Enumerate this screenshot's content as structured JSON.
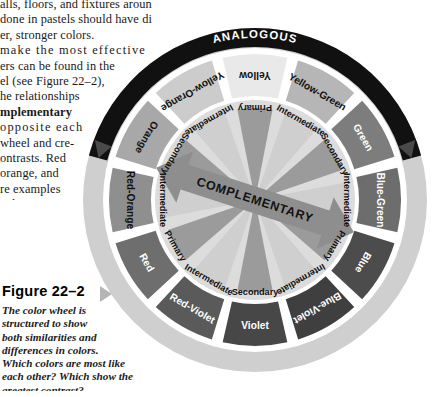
{
  "body_text": {
    "lines": [
      {
        "text": "alls, floors, and fixtures around them.",
        "bold": false,
        "clip_top": true
      },
      {
        "text": "done in pastels should have dis-",
        "bold": false
      },
      {
        "text": "er, stronger colors.",
        "bold": false
      },
      {
        "text": "make the most effective",
        "bold": false,
        "spaced": true
      },
      {
        "text": "ers can be found in the",
        "bold": false
      },
      {
        "text": "el (see Figure 22–2),",
        "bold": false
      },
      {
        "text": "he relationships",
        "bold": false
      },
      {
        "text": "mplementary",
        "bold": true
      },
      {
        "text": "opposite each",
        "bold": false,
        "spaced": true
      },
      {
        "text": "wheel and cre-",
        "bold": false
      },
      {
        "text": "ontrasts.  Red",
        "bold": false
      },
      {
        "text": "orange, and",
        "bold": false
      },
      {
        "text": "re examples",
        "bold": false
      },
      {
        "text": "colors.",
        "bold": false
      }
    ]
  },
  "figure": {
    "title": "Figure 22–2",
    "caption_lines": [
      "The color wheel is",
      "structured to show",
      "both similarities and",
      "differences in colors.",
      "Which colors are most like",
      "each other? Which show the",
      "greatest contrast?"
    ]
  },
  "wheel": {
    "banner_label": "ANALOGOUS",
    "complementary_label": "COMPLEMENTARY",
    "hues": [
      {
        "name": "Yellow",
        "tier": "Primary",
        "swatch": "#e9e9e9",
        "text": "#111111"
      },
      {
        "name": "Yellow-Green",
        "tier": "Intermediate",
        "swatch": "#b6b6b6",
        "text": "#111111"
      },
      {
        "name": "Green",
        "tier": "Secondary",
        "swatch": "#7d7d7d",
        "text": "#ffffff"
      },
      {
        "name": "Blue-Green",
        "tier": "Intermediate",
        "swatch": "#6d6d6d",
        "text": "#ffffff"
      },
      {
        "name": "Blue",
        "tier": "Primary",
        "swatch": "#4c4c4c",
        "text": "#ffffff"
      },
      {
        "name": "Blue-Violet",
        "tier": "Intermediate",
        "swatch": "#3f3f3f",
        "text": "#ffffff"
      },
      {
        "name": "Violet",
        "tier": "Secondary",
        "swatch": "#474747",
        "text": "#ffffff"
      },
      {
        "name": "Red-Violet",
        "tier": "Intermediate",
        "swatch": "#5a5a5a",
        "text": "#ffffff"
      },
      {
        "name": "Red",
        "tier": "Primary",
        "swatch": "#6e6e6e",
        "text": "#ffffff"
      },
      {
        "name": "Red-Orange",
        "tier": "Intermediate",
        "swatch": "#8f8f8f",
        "text": "#111111"
      },
      {
        "name": "Orange",
        "tier": "Secondary",
        "swatch": "#a8a8a8",
        "text": "#111111"
      },
      {
        "name": "Yellow-Orange",
        "tier": "Intermediate",
        "swatch": "#cccccc",
        "text": "#111111"
      }
    ],
    "colors": {
      "outer_ring": "#cfcfcf",
      "banner": "#111111",
      "inner_disc": "#dcdcdc",
      "wedge_light": "#cfcfcf",
      "wedge_dark": "#9b9b9b",
      "arrow": "#8e8e8e",
      "gap": "#ffffff"
    }
  }
}
